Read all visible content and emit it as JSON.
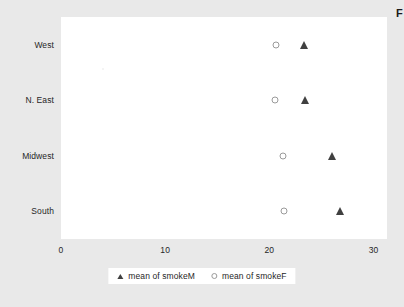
{
  "edge_caption": "F",
  "chart_data": {
    "type": "scatter",
    "title": "",
    "xlabel": "",
    "ylabel": "",
    "orientation": "horizontal",
    "categories": [
      "West",
      "N. East",
      "Midwest",
      "South"
    ],
    "xlim": [
      0,
      31.3
    ],
    "xticks": [
      0,
      10,
      20,
      30
    ],
    "xtick_labels": [
      "0",
      "10",
      "20",
      "30"
    ],
    "grid": false,
    "legend_position": "bottom-center",
    "series": [
      {
        "name": "mean of smokeM",
        "marker": "filled-triangle",
        "color": "#404040",
        "values": [
          23.3,
          23.4,
          26.0,
          26.8
        ]
      },
      {
        "name": "mean of smokeF",
        "marker": "open-circle",
        "color": "#9a9a9a",
        "values": [
          20.6,
          20.5,
          21.3,
          21.4
        ]
      }
    ]
  },
  "legend": {
    "items": [
      {
        "label": "mean of smokeM",
        "marker": "triangle-icon"
      },
      {
        "label": "mean of smokeF",
        "marker": "circle-icon"
      }
    ]
  }
}
